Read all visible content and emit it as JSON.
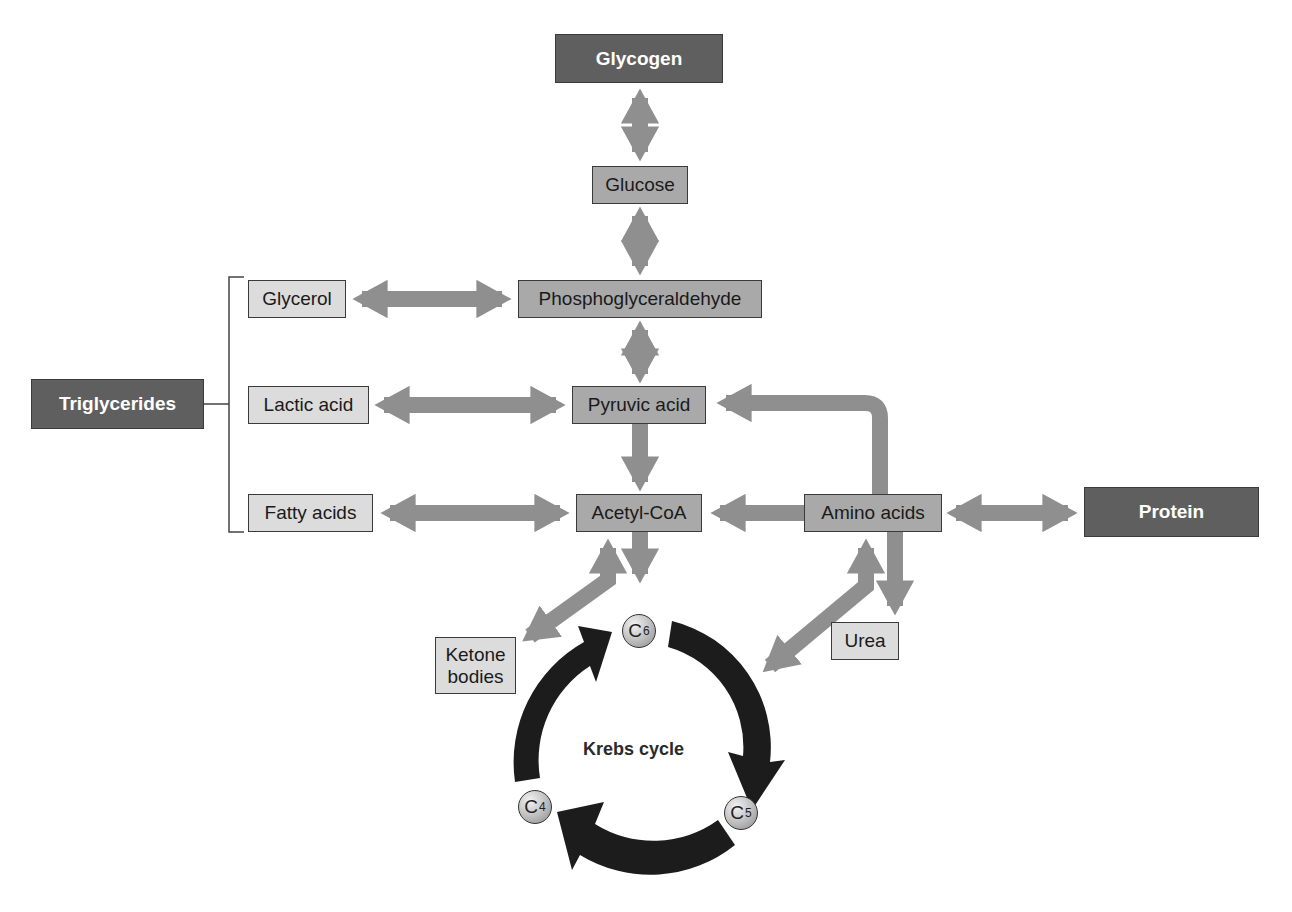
{
  "diagram": {
    "type": "metabolic-pathway",
    "colors": {
      "dark_box": "#5f5f5f",
      "mid_box": "#a9a9a9",
      "light_box": "#dcdcdc",
      "arrow": "#8f8f8f",
      "cycle_arrow": "#1c1c1c"
    },
    "nodes": {
      "glycogen": "Glycogen",
      "glucose": "Glucose",
      "phosphoglyceraldehyde": "Phosphoglyceraldehyde",
      "glycerol": "Glycerol",
      "triglycerides": "Triglycerides",
      "lactic_acid": "Lactic acid",
      "pyruvic_acid": "Pyruvic acid",
      "fatty_acids": "Fatty acids",
      "acetyl_coa": "Acetyl-CoA",
      "amino_acids": "Amino acids",
      "protein": "Protein",
      "ketone_bodies": "Ketone bodies",
      "urea": "Urea"
    },
    "krebs": {
      "label": "Krebs cycle",
      "c6": {
        "base": "C",
        "sub": "6"
      },
      "c5": {
        "base": "C",
        "sub": "5"
      },
      "c4": {
        "base": "C",
        "sub": "4"
      }
    },
    "edges": [
      {
        "from": "Glycogen",
        "to": "Glucose",
        "bidirectional": true
      },
      {
        "from": "Glucose",
        "to": "Phosphoglyceraldehyde",
        "bidirectional": true
      },
      {
        "from": "Glycerol",
        "to": "Phosphoglyceraldehyde",
        "bidirectional": true
      },
      {
        "from": "Phosphoglyceraldehyde",
        "to": "Pyruvic acid",
        "bidirectional": true
      },
      {
        "from": "Lactic acid",
        "to": "Pyruvic acid",
        "bidirectional": true
      },
      {
        "from": "Pyruvic acid",
        "to": "Acetyl-CoA",
        "bidirectional": false
      },
      {
        "from": "Fatty acids",
        "to": "Acetyl-CoA",
        "bidirectional": true
      },
      {
        "from": "Amino acids",
        "to": "Acetyl-CoA",
        "bidirectional": false
      },
      {
        "from": "Amino acids",
        "to": "Pyruvic acid",
        "bidirectional": false
      },
      {
        "from": "Amino acids",
        "to": "Protein",
        "bidirectional": true
      },
      {
        "from": "Amino acids",
        "to": "Urea",
        "bidirectional": false
      },
      {
        "from": "Acetyl-CoA",
        "to": "Krebs cycle (C6)",
        "bidirectional": false
      },
      {
        "from": "Acetyl-CoA",
        "to": "Ketone bodies",
        "bidirectional": true
      },
      {
        "from": "Amino acids",
        "to": "Krebs cycle",
        "bidirectional": true
      },
      {
        "from": "Triglycerides",
        "to": [
          "Glycerol",
          "Lactic acid",
          "Fatty acids"
        ],
        "type": "bracket"
      }
    ]
  }
}
